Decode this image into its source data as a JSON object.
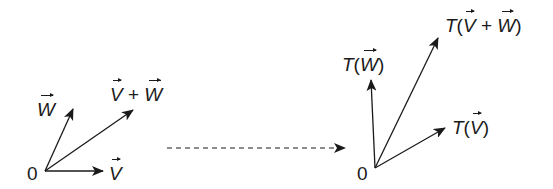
{
  "diagram": {
    "colors": {
      "ink": "#1a1a1a",
      "background": "#ffffff"
    },
    "left": {
      "origin_label": "0",
      "vectors": [
        {
          "id": "v",
          "symbol": "V",
          "label_prefix": "",
          "label_suffix": ""
        },
        {
          "id": "w",
          "symbol": "W",
          "label_prefix": "",
          "label_suffix": ""
        },
        {
          "id": "v_plus_w",
          "symbol_a": "V",
          "operator": "+",
          "symbol_b": "W"
        }
      ]
    },
    "mapping_arrow": {
      "style": "dashed"
    },
    "right": {
      "origin_label": "0",
      "vectors": [
        {
          "id": "tv",
          "fn": "T",
          "open": "(",
          "symbol": "V",
          "close": ")"
        },
        {
          "id": "tw",
          "fn": "T",
          "open": "(",
          "symbol": "W",
          "close": ")"
        },
        {
          "id": "tv_plus_w",
          "fn": "T",
          "open": "(",
          "symbol_a": "V",
          "operator": "+",
          "symbol_b": "W",
          "close": ")"
        }
      ]
    }
  }
}
